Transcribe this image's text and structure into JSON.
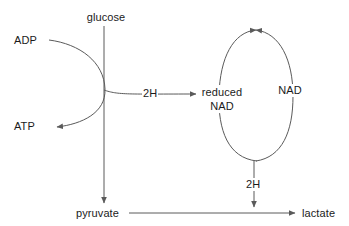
{
  "diagram": {
    "stroke_color": "#5a5a5a",
    "text_color": "#1b1b1b",
    "background_color": "#ffffff",
    "nodes": {
      "glucose": "glucose",
      "adp": "ADP",
      "atp": "ATP",
      "pyruvate": "pyruvate",
      "lactate": "lactate",
      "reduced_nad_line1": "reduced",
      "reduced_nad_line2": "NAD",
      "nad": "NAD",
      "two_h_upper": "2H",
      "two_h_lower": "2H"
    },
    "edges": [
      {
        "name": "glucose-to-pyruvate",
        "from": "glucose",
        "to": "pyruvate",
        "style": "straight-down-arrow"
      },
      {
        "name": "adp-to-atp",
        "from": "ADP",
        "to": "ATP",
        "style": "curved-arrow"
      },
      {
        "name": "two-h-to-reduced-nad",
        "from": "2H",
        "to": "reduced NAD",
        "style": "straight-right-arrow"
      },
      {
        "name": "nad-to-reduced-nad",
        "from": "NAD",
        "to": "reduced NAD",
        "style": "ellipse-left-arc-down"
      },
      {
        "name": "reduced-nad-to-nad",
        "from": "reduced NAD",
        "to": "NAD",
        "style": "ellipse-right-arc-up"
      },
      {
        "name": "two-h-to-lactate-line",
        "from": "2H",
        "to": "pyruvate-lactate",
        "style": "straight-down-arrow"
      },
      {
        "name": "pyruvate-to-lactate",
        "from": "pyruvate",
        "to": "lactate",
        "style": "straight-right-arrow"
      }
    ]
  }
}
